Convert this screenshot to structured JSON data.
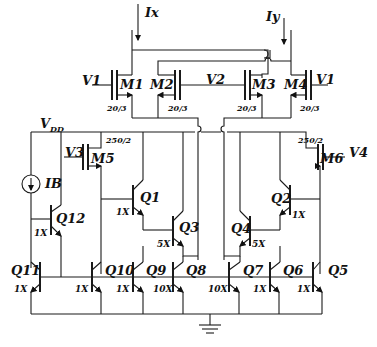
{
  "diagram": {
    "type": "circuit-schematic",
    "supply": {
      "label": "V",
      "sub": "DD"
    },
    "ground": "ground-symbol",
    "inputs": {
      "ix": "Ix",
      "iy": "Iy"
    },
    "bias_source": "IB",
    "mosfets": [
      {
        "name": "M1",
        "gate": "V1",
        "size": "20/3"
      },
      {
        "name": "M2",
        "gate": "V2",
        "size": "20/3"
      },
      {
        "name": "M3",
        "gate": "V2",
        "size": "20/3"
      },
      {
        "name": "M4",
        "gate": "V1",
        "size": "20/3"
      },
      {
        "name": "M5",
        "gate": "V3",
        "size": "250/2"
      },
      {
        "name": "M6",
        "gate": "V4",
        "size": "250/2"
      }
    ],
    "bjts": [
      {
        "name": "Q1",
        "size": "1X"
      },
      {
        "name": "Q2",
        "size": "1X"
      },
      {
        "name": "Q3",
        "size": "5X"
      },
      {
        "name": "Q4",
        "size": "5X"
      },
      {
        "name": "Q5",
        "size": "1X"
      },
      {
        "name": "Q6",
        "size": "1X"
      },
      {
        "name": "Q7",
        "size": "10X"
      },
      {
        "name": "Q8",
        "size": "10X"
      },
      {
        "name": "Q9",
        "size": "1X"
      },
      {
        "name": "Q10",
        "size": "1X"
      },
      {
        "name": "Q11",
        "size": "1X"
      },
      {
        "name": "Q12",
        "size": "1X"
      }
    ],
    "gate_labels": {
      "v1_left": "V1",
      "v1_right": "V1",
      "v2": "V2",
      "v3": "V3",
      "v4": "V4"
    }
  }
}
